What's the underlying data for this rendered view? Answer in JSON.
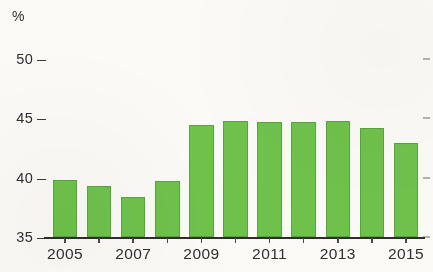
{
  "chart_data": {
    "type": "bar",
    "title": "",
    "subtitle": "",
    "xlabel": "",
    "ylabel": "%",
    "unit_label": "%",
    "categories": [
      "2005",
      "2006",
      "2007",
      "2008",
      "2009",
      "2010",
      "2011",
      "2012",
      "2013",
      "2014",
      "2015"
    ],
    "values": [
      39.8,
      39.3,
      38.4,
      39.7,
      44.4,
      44.8,
      44.7,
      44.7,
      44.8,
      44.2,
      42.9
    ],
    "series": [
      {
        "name": "",
        "values": [
          39.8,
          39.3,
          38.4,
          39.7,
          44.4,
          44.8,
          44.7,
          44.7,
          44.8,
          44.2,
          42.9
        ]
      }
    ],
    "ylim": [
      35,
      51.5
    ],
    "yticks": [
      35,
      40,
      45,
      50
    ],
    "ytick_labels": [
      "35",
      "40",
      "45",
      "50"
    ],
    "xtick_labels": [
      "2005",
      "2007",
      "2009",
      "2011",
      "2013",
      "2015"
    ],
    "xticks_all": [
      "2005",
      "2006",
      "2007",
      "2008",
      "2009",
      "2010",
      "2011",
      "2012",
      "2013",
      "2014",
      "2015"
    ],
    "grid": false,
    "legend": null,
    "legend_position": "none",
    "annotations": [],
    "bar_color": "#6ec24b",
    "bar_border_color": "#57a63a",
    "axis_color": "#2e2e2e",
    "text_color": "#2f2f2f",
    "background_color": "#fbfaf7"
  }
}
